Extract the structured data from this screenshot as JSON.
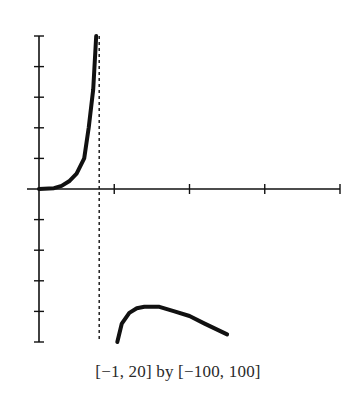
{
  "chart_data": {
    "type": "line",
    "title": "",
    "caption": "[−1,  20] by [−100,  100]",
    "xlabel": "",
    "ylabel": "",
    "xlim": [
      -1,
      20
    ],
    "ylim": [
      -100,
      100
    ],
    "x_ticks": [
      5,
      10,
      15,
      20
    ],
    "y_ticks": [
      -100,
      -80,
      -60,
      -40,
      -20,
      20,
      40,
      60,
      80,
      100
    ],
    "grid": false,
    "legend": null,
    "vertical_asymptote": {
      "x": 4,
      "style": "dashed"
    },
    "series": [
      {
        "name": "left branch",
        "x": [
          0,
          1,
          1.5,
          2,
          2.5,
          3,
          3.3,
          3.6,
          3.8
        ],
        "y": [
          0,
          0.5,
          2,
          5,
          10,
          20,
          40,
          65,
          100
        ]
      },
      {
        "name": "right branch",
        "x": [
          5.2,
          5.5,
          6,
          6.5,
          7,
          8,
          9,
          10,
          11,
          12.5
        ],
        "y": [
          -100,
          -88,
          -81,
          -78,
          -77,
          -77,
          -80,
          -83,
          -88,
          -95
        ]
      }
    ]
  }
}
